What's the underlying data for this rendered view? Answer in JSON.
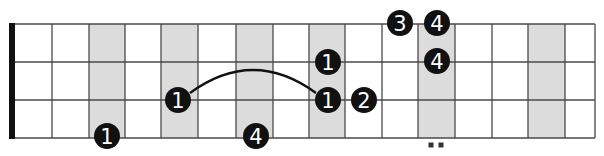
{
  "diagram": {
    "colors": {
      "background": "#ffffff",
      "shade": "#dcdcdc",
      "line": "#4a4a4a",
      "nut": "#111111",
      "dot": "#111111",
      "dot_text": "#ffffff"
    },
    "fretboard": {
      "nut_x": 12,
      "string_y": [
        24,
        62,
        100,
        138
      ],
      "fret_x": [
        15,
        52,
        89,
        125,
        161,
        198,
        236,
        273,
        309,
        345,
        382,
        418,
        455,
        492,
        528,
        565,
        595
      ],
      "shaded_frets": [
        3,
        5,
        7,
        9,
        12,
        15
      ]
    },
    "fingers": [
      {
        "label": "1",
        "x": 107,
        "y": 136
      },
      {
        "label": "1",
        "x": 178,
        "y": 100
      },
      {
        "label": "4",
        "x": 256,
        "y": 136
      },
      {
        "label": "1",
        "x": 328,
        "y": 62
      },
      {
        "label": "1",
        "x": 328,
        "y": 100
      },
      {
        "label": "2",
        "x": 364,
        "y": 100
      },
      {
        "label": "3",
        "x": 400,
        "y": 23
      },
      {
        "label": "4",
        "x": 437,
        "y": 23
      },
      {
        "label": "4",
        "x": 437,
        "y": 61
      }
    ],
    "slide_arc": {
      "from": [
        190,
        93
      ],
      "to": [
        316,
        93
      ],
      "peak_y": 70
    },
    "double_dot_marker": {
      "x": [
        431,
        441
      ],
      "y": 145
    }
  }
}
